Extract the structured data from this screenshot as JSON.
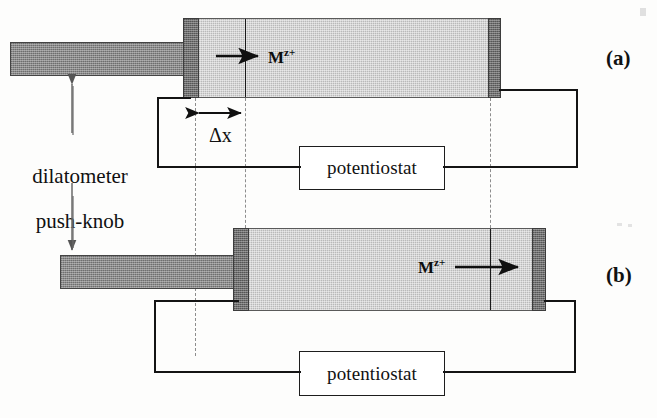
{
  "figure": {
    "background_color": "#fdfdfc"
  },
  "panels": [
    {
      "id": "a",
      "label": "(a)",
      "species_label": "M",
      "species_charge": "z+",
      "arrow_direction": "right",
      "instrument_label": "potentiostat",
      "state": "knob retracted, electrode at left position"
    },
    {
      "id": "b",
      "label": "(b)",
      "species_label": "M",
      "species_charge": "z+",
      "arrow_direction": "right",
      "instrument_label": "potentiostat",
      "state": "knob advanced, electrode displaced right by delta x"
    }
  ],
  "annotations": {
    "push_knob_line1": "dilatometer",
    "push_knob_line2": "push-knob",
    "push_knob_text": "dilatometer\npush-knob",
    "displacement_label": "Δx",
    "displacement_symbol": "Δx"
  },
  "colors": {
    "electrolyte": "#b9b9b9",
    "electrode": "#6e6e6e",
    "push_knob": "#8a8a8a",
    "wire": "#141414",
    "guide": "#8d8d8d",
    "text": "#111111",
    "instrument_fill": "#ffffff"
  },
  "icons": {
    "ion_flux_arrow": "right-arrow-icon",
    "displacement_arrow": "double-headed-horizontal-arrow-icon",
    "knob_travel_arrow": "double-headed-vertical-arrow-icon",
    "leader_arrow": "leader-arrow-icon"
  }
}
